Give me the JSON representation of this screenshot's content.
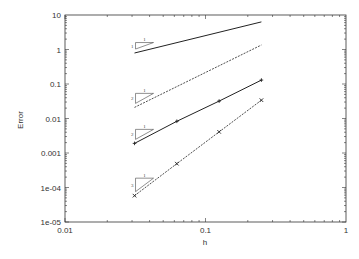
{
  "chart_data": {
    "type": "line",
    "title": "",
    "xlabel": "h",
    "ylabel": "Error",
    "xscale": "log",
    "yscale": "log",
    "xlim": [
      0.01,
      1
    ],
    "ylim": [
      1e-05,
      10
    ],
    "xticks": [
      "0.01",
      "0.1",
      "1"
    ],
    "yticks": [
      "10",
      "1",
      "0.1",
      "0.01",
      "0.001",
      "1e-04",
      "1e-05"
    ],
    "grid": false,
    "legend": null,
    "series": [
      {
        "name": "slope-1",
        "style": "solid",
        "marker": "none",
        "x": [
          0.03125,
          0.25
        ],
        "y": [
          0.79,
          6.3
        ]
      },
      {
        "name": "slope-2-dashed",
        "style": "dashed",
        "marker": "none",
        "x": [
          0.03125,
          0.25
        ],
        "y": [
          0.021,
          1.35
        ]
      },
      {
        "name": "slope-2-solid",
        "style": "solid",
        "marker": "plus",
        "x": [
          0.03125,
          0.0625,
          0.125,
          0.25
        ],
        "y": [
          0.0019,
          0.0083,
          0.032,
          0.13
        ]
      },
      {
        "name": "slope-3-dashed",
        "style": "dashed",
        "marker": "cross",
        "x": [
          0.03125,
          0.0625,
          0.125,
          0.25
        ],
        "y": [
          5.8e-05,
          0.00049,
          0.0041,
          0.034
        ]
      }
    ],
    "annotations": [
      {
        "type": "slope-triangle",
        "rise": "1",
        "run": "1",
        "near_series": 0
      },
      {
        "type": "slope-triangle",
        "rise": "2",
        "run": "1",
        "near_series": 1
      },
      {
        "type": "slope-triangle",
        "rise": "2",
        "run": "1",
        "near_series": 2
      },
      {
        "type": "slope-triangle",
        "rise": "3",
        "run": "1",
        "near_series": 3
      }
    ]
  }
}
